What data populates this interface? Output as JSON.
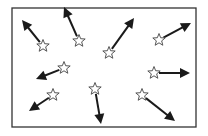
{
  "diagram": {
    "title": "",
    "colors": {
      "background": "#ffffff",
      "border": "#333333",
      "arrow": "#1a1a1a",
      "star_stroke": "#555555",
      "star_fill": "#ffffff"
    },
    "frame": {
      "x": 12,
      "y": 8,
      "width": 184,
      "height": 119
    },
    "vectors": [
      {
        "id": "v1",
        "star": [
          43,
          46
        ],
        "tip": [
          22,
          20
        ]
      },
      {
        "id": "v2",
        "star": [
          79,
          41
        ],
        "tip": [
          64,
          7
        ]
      },
      {
        "id": "v3",
        "star": [
          109,
          53
        ],
        "tip": [
          134,
          18
        ]
      },
      {
        "id": "v4",
        "star": [
          159,
          40
        ],
        "tip": [
          191,
          23
        ]
      },
      {
        "id": "v5",
        "star": [
          64,
          68
        ],
        "tip": [
          36,
          79
        ]
      },
      {
        "id": "v6",
        "star": [
          53,
          95
        ],
        "tip": [
          29,
          111
        ]
      },
      {
        "id": "v7",
        "star": [
          154,
          73
        ],
        "tip": [
          190,
          73
        ]
      },
      {
        "id": "v8",
        "star": [
          142,
          95
        ],
        "tip": [
          175,
          121
        ]
      },
      {
        "id": "v9",
        "star": [
          95,
          89
        ],
        "tip": [
          101,
          124
        ]
      }
    ]
  }
}
